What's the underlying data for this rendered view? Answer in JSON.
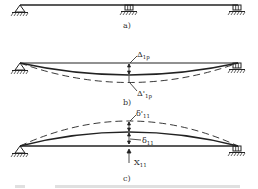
{
  "panels": {
    "a": {
      "label": "a)"
    },
    "b": {
      "label": "b)",
      "top_label": "Δ",
      "top_sub": "1p",
      "bottom_label": "Δ'",
      "bottom_sub": "1p"
    },
    "c": {
      "label": "c)",
      "top_label": "δ'",
      "top_sub": "11",
      "mid_label": "δ",
      "mid_sub": "11",
      "force_label": "X",
      "force_sub": "11"
    }
  },
  "colors": {
    "line": "#222222",
    "caption": "#d8d8d8"
  }
}
